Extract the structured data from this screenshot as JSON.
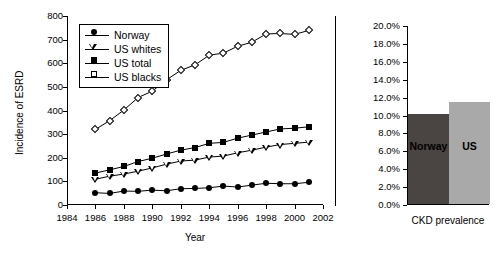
{
  "chart_data": [
    {
      "type": "line",
      "title": "",
      "xlabel": "Year",
      "ylabel": "Incidence of ESRD",
      "xlim": [
        1984,
        2002
      ],
      "ylim": [
        0,
        800
      ],
      "xticks": [
        1984,
        1986,
        1988,
        1990,
        1992,
        1994,
        1996,
        1998,
        2000,
        2002
      ],
      "yticks": [
        0,
        100,
        200,
        300,
        400,
        500,
        600,
        700,
        800
      ],
      "grid": false,
      "legend_position": "upper-left",
      "x": [
        1986,
        1987,
        1988,
        1989,
        1990,
        1991,
        1992,
        1993,
        1994,
        1995,
        1996,
        1997,
        1998,
        1999,
        2000,
        2001
      ],
      "series": [
        {
          "name": "Norway",
          "marker": "filled-circle",
          "values": [
            52,
            49,
            59,
            58,
            63,
            60,
            69,
            70,
            73,
            80,
            76,
            84,
            92,
            90,
            90,
            96
          ]
        },
        {
          "name": "US whites",
          "marker": "open-triangle-down",
          "values": [
            109,
            122,
            131,
            143,
            157,
            173,
            186,
            190,
            203,
            207,
            221,
            232,
            245,
            256,
            261,
            266
          ]
        },
        {
          "name": "US total",
          "marker": "filled-square",
          "values": [
            135,
            149,
            163,
            184,
            198,
            216,
            232,
            243,
            261,
            265,
            283,
            296,
            309,
            322,
            325,
            331
          ]
        },
        {
          "name": "US blacks",
          "marker": "open-diamond",
          "values": [
            320,
            357,
            402,
            455,
            482,
            530,
            570,
            593,
            634,
            643,
            672,
            689,
            724,
            726,
            722,
            739
          ]
        }
      ]
    },
    {
      "type": "bar",
      "title": "",
      "xlabel": "CKD prevalence",
      "ylabel": "",
      "ylim": [
        0,
        20
      ],
      "yticks": [
        0,
        2,
        4,
        6,
        8,
        10,
        12,
        14,
        16,
        18,
        20
      ],
      "ytick_labels": [
        "0.0%",
        "2.0%",
        "4.0%",
        "6.0%",
        "8.0%",
        "10.0%",
        "12.0%",
        "14.0%",
        "16.0%",
        "18.0%",
        "20.0%"
      ],
      "grid": false,
      "categories": [
        "Norway",
        "US"
      ],
      "values": [
        10.1,
        11.4
      ],
      "value_labels": [
        "10.1%",
        "11.4%"
      ],
      "colors": [
        "#4a4542",
        "#a9a9a9"
      ]
    }
  ],
  "line_chart": {
    "ylabel": "Incidence of ESRD",
    "xlabel": "Year",
    "ytick_labels": [
      "800",
      "700",
      "600",
      "500",
      "400",
      "300",
      "200",
      "100",
      "0"
    ],
    "xtick_labels": [
      "1984",
      "1986",
      "1988",
      "1990",
      "1992",
      "1994",
      "1996",
      "1998",
      "2000",
      "2002"
    ],
    "legend": [
      {
        "label": "Norway"
      },
      {
        "label": "US whites"
      },
      {
        "label": "US total"
      },
      {
        "label": "US blacks"
      }
    ]
  },
  "bar_chart": {
    "xlabel": "CKD prevalence",
    "ytick_labels": [
      "20.0%",
      "18.0%",
      "16.0%",
      "14.0%",
      "12.0%",
      "10.0%",
      "8.0%",
      "6.0%",
      "4.0%",
      "2.0%",
      "0.0%"
    ],
    "bars": [
      {
        "label": "Norway",
        "color": "#4a4542"
      },
      {
        "label": "US",
        "color": "#a9a9a9"
      }
    ]
  }
}
